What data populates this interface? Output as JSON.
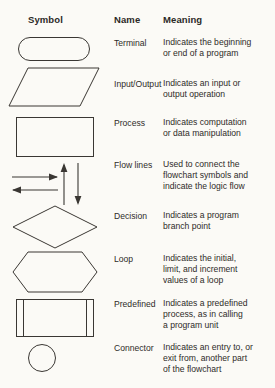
{
  "table": {
    "headers": {
      "symbol": "Symbol",
      "name": "Name",
      "meaning": "Meaning"
    },
    "rows": [
      {
        "symbol_shape": "stadium-rounded-rectangle",
        "name": "Terminal",
        "meaning_lines": [
          "Indicates the beginning",
          "or end of a program"
        ]
      },
      {
        "symbol_shape": "parallelogram",
        "name": "Input/Output",
        "meaning_lines": [
          "Indicates an input or",
          "output operation"
        ]
      },
      {
        "symbol_shape": "rectangle",
        "name": "Process",
        "meaning_lines": [
          "Indicates computation",
          "or data manipulation"
        ]
      },
      {
        "symbol_shape": "arrows-flow-lines",
        "name": "Flow lines",
        "meaning_lines": [
          "Used to connect the",
          "flowchart symbols and",
          "indicate the logic flow"
        ]
      },
      {
        "symbol_shape": "diamond",
        "name": "Decision",
        "meaning_lines": [
          "Indicates a program",
          "branch point"
        ]
      },
      {
        "symbol_shape": "hexagon",
        "name": "Loop",
        "meaning_lines": [
          "Indicates the initial,",
          "limit, and increment",
          "values of a loop"
        ]
      },
      {
        "symbol_shape": "rectangle-double-bars",
        "name": "Predefined",
        "meaning_lines": [
          "Indicates a predefined",
          "process, as in calling",
          "a program unit"
        ]
      },
      {
        "symbol_shape": "circle",
        "name": "Connector",
        "meaning_lines": [
          "Indicates an entry to, or",
          "exit from, another part",
          "of the flowchart"
        ]
      }
    ]
  },
  "colors": {
    "paper": "#fbfaf6",
    "ink": "#2e2b28",
    "stroke": "#3a3733"
  }
}
